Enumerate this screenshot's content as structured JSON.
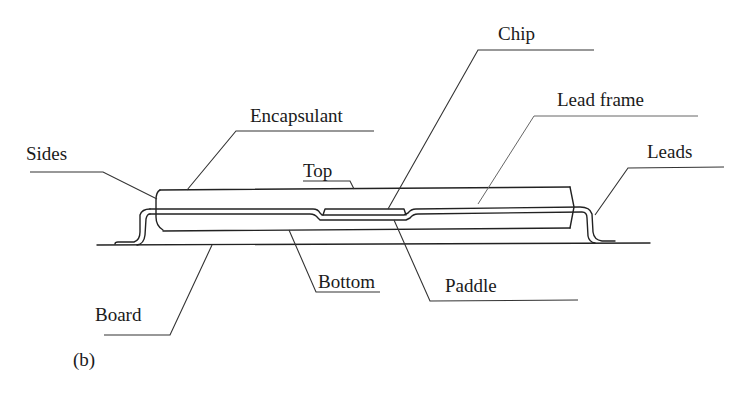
{
  "figure": {
    "panel_label": "(b)"
  },
  "labels": {
    "sides": "Sides",
    "encapsulant": "Encapsulant",
    "top": "Top",
    "chip": "Chip",
    "lead_frame": "Lead frame",
    "leads": "Leads",
    "bottom": "Bottom",
    "paddle": "Paddle",
    "board": "Board"
  },
  "colors": {
    "ink": "#222222",
    "background": "#ffffff"
  }
}
